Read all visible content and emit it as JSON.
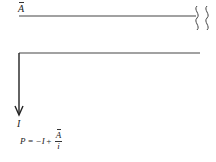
{
  "diagram": {
    "top_line": {
      "label": "A",
      "label_has_overbar": true,
      "break_symbol": "wavy-double-break"
    },
    "bottom_line": {
      "has_down_arrow": true
    },
    "arrow_label": "I",
    "formula": {
      "lhs": "P",
      "eq": "=",
      "term1": "−I",
      "plus": "+",
      "numerator": "A",
      "numerator_has_overbar": true,
      "denominator": "i"
    }
  }
}
